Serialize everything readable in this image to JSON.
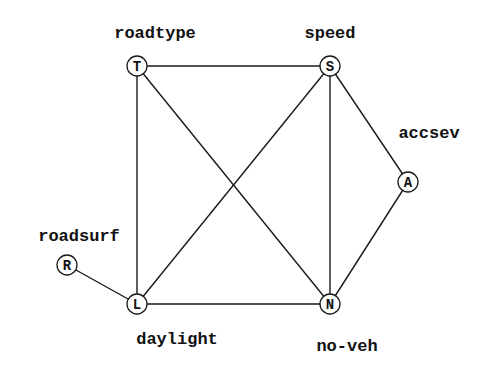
{
  "diagram": {
    "type": "undirected graph",
    "nodes": [
      {
        "id": "T",
        "letter": "T",
        "label": "roadtype",
        "x": 137,
        "y": 66,
        "label_x": 155,
        "label_y": 38,
        "anchor": "middle"
      },
      {
        "id": "S",
        "letter": "S",
        "label": "speed",
        "x": 330,
        "y": 66,
        "label_x": 330,
        "label_y": 38,
        "anchor": "middle"
      },
      {
        "id": "A",
        "letter": "A",
        "label": "accsev",
        "x": 408,
        "y": 182,
        "label_x": 429,
        "label_y": 138,
        "anchor": "middle"
      },
      {
        "id": "R",
        "letter": "R",
        "label": "roadsurf",
        "x": 67,
        "y": 265,
        "label_x": 79,
        "label_y": 241,
        "anchor": "middle"
      },
      {
        "id": "L",
        "letter": "L",
        "label": "daylight",
        "x": 137,
        "y": 304,
        "label_x": 177,
        "label_y": 344,
        "anchor": "middle"
      },
      {
        "id": "N",
        "letter": "N",
        "label": "no-veh",
        "x": 330,
        "y": 304,
        "label_x": 347,
        "label_y": 351,
        "anchor": "middle"
      }
    ],
    "edges": [
      [
        "T",
        "S"
      ],
      [
        "T",
        "L"
      ],
      [
        "T",
        "N"
      ],
      [
        "S",
        "L"
      ],
      [
        "S",
        "N"
      ],
      [
        "S",
        "A"
      ],
      [
        "A",
        "N"
      ],
      [
        "R",
        "L"
      ],
      [
        "L",
        "N"
      ]
    ],
    "node_radius": 10,
    "colors": {
      "stroke": "#1a1a1a",
      "background": "#ffffff",
      "text": "#111111"
    }
  }
}
